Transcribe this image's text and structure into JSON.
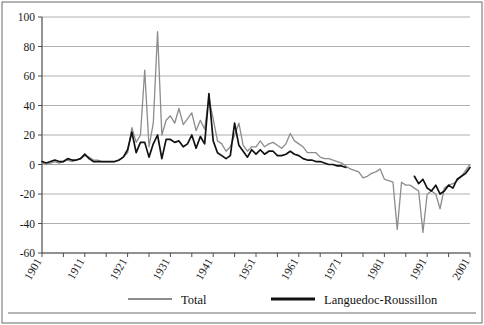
{
  "chart_data": {
    "type": "line",
    "title": "",
    "subtitle": "",
    "xlabel": "",
    "ylabel": "",
    "xlim": [
      1901,
      2001
    ],
    "ylim": [
      -60,
      100
    ],
    "y_ticks": [
      100,
      80,
      60,
      40,
      20,
      0,
      -20,
      -40,
      -60
    ],
    "y_tick_labels": [
      "100",
      "80",
      "60",
      "40",
      "20",
      "0",
      "-20",
      "-40",
      "-60"
    ],
    "x_ticks": [
      1901,
      1906,
      1911,
      1916,
      1921,
      1926,
      1931,
      1936,
      1941,
      1946,
      1951,
      1956,
      1961,
      1966,
      1971,
      1976,
      1981,
      1986,
      1991,
      1996,
      2001
    ],
    "x_tick_labels": [
      "1901",
      "1911",
      "1921",
      "1931",
      "1941",
      "1951",
      "1961",
      "1971",
      "1981",
      "1991",
      "2001"
    ],
    "x_labeled_ticks": [
      1901,
      1911,
      1921,
      1931,
      1941,
      1951,
      1961,
      1971,
      1981,
      1991,
      2001
    ],
    "grid": "horizontal",
    "legend_position": "bottom",
    "legend": [
      "Total",
      "Languedoc-Roussillon"
    ],
    "series": [
      {
        "name": "Total",
        "color": "#8c8c8c",
        "x": [
          1901,
          1902,
          1903,
          1904,
          1905,
          1906,
          1907,
          1908,
          1909,
          1910,
          1911,
          1912,
          1913,
          1914,
          1915,
          1916,
          1917,
          1918,
          1919,
          1920,
          1921,
          1922,
          1923,
          1924,
          1925,
          1926,
          1927,
          1928,
          1929,
          1930,
          1931,
          1932,
          1933,
          1934,
          1935,
          1936,
          1937,
          1938,
          1939,
          1940,
          1941,
          1942,
          1943,
          1944,
          1945,
          1946,
          1947,
          1948,
          1949,
          1950,
          1951,
          1952,
          1953,
          1954,
          1955,
          1956,
          1957,
          1958,
          1959,
          1960,
          1961,
          1962,
          1963,
          1964,
          1965,
          1966,
          1967,
          1968,
          1969,
          1970,
          1971,
          1972,
          1973,
          1974,
          1975,
          1976,
          1977,
          1978,
          1979,
          1980,
          1981,
          1982,
          1983,
          1984,
          1985,
          1986,
          1987,
          1988,
          1989,
          1990,
          1991,
          1992,
          1993,
          1994,
          1995,
          1996,
          1997,
          1998,
          1999,
          2000,
          2001
        ],
        "values": [
          1,
          0,
          1,
          2,
          1,
          2,
          3,
          2,
          3,
          4,
          6,
          5,
          3,
          3,
          2,
          2,
          2,
          2,
          3,
          5,
          8,
          25,
          15,
          20,
          64,
          12,
          28,
          90,
          20,
          30,
          33,
          28,
          38,
          27,
          31,
          35,
          23,
          30,
          24,
          45,
          31,
          16,
          14,
          9,
          12,
          20,
          28,
          13,
          9,
          12,
          12,
          16,
          12,
          14,
          15,
          13,
          11,
          14,
          21,
          16,
          14,
          12,
          8,
          8,
          8,
          5,
          4,
          4,
          3,
          2,
          1,
          -1,
          -3,
          -4,
          -5,
          -9,
          -8,
          -6,
          -5,
          -3,
          -10,
          -11,
          -12,
          -44,
          -12,
          -14,
          -14,
          -16,
          -18,
          -46,
          -20,
          -18,
          -20,
          -30,
          -16,
          -14,
          -13,
          -11,
          -8,
          -4,
          0
        ]
      },
      {
        "name": "Languedoc-Roussillon",
        "color": "#111111",
        "x": [
          1901,
          1902,
          1903,
          1904,
          1905,
          1906,
          1907,
          1908,
          1909,
          1910,
          1911,
          1912,
          1913,
          1914,
          1915,
          1916,
          1917,
          1918,
          1919,
          1920,
          1921,
          1922,
          1923,
          1924,
          1925,
          1926,
          1927,
          1928,
          1929,
          1930,
          1931,
          1932,
          1933,
          1934,
          1935,
          1936,
          1937,
          1938,
          1939,
          1940,
          1941,
          1942,
          1943,
          1944,
          1945,
          1946,
          1947,
          1948,
          1949,
          1950,
          1951,
          1952,
          1953,
          1954,
          1955,
          1956,
          1957,
          1958,
          1959,
          1960,
          1961,
          1962,
          1963,
          1964,
          1965,
          1966,
          1967,
          1968,
          1969,
          1970,
          1971,
          1972,
          1988,
          1989,
          1990,
          1991,
          1992,
          1993,
          1994,
          1995,
          1996,
          1997,
          1998,
          1999,
          2000,
          2001
        ],
        "values": [
          2,
          1,
          2,
          3,
          2,
          2,
          4,
          3,
          3,
          4,
          7,
          4,
          2,
          2,
          2,
          2,
          2,
          2,
          3,
          5,
          10,
          22,
          8,
          15,
          15,
          5,
          14,
          20,
          4,
          17,
          17,
          15,
          16,
          12,
          14,
          20,
          11,
          19,
          14,
          48,
          16,
          8,
          6,
          4,
          6,
          28,
          13,
          9,
          5,
          10,
          7,
          10,
          7,
          9,
          9,
          6,
          6,
          7,
          9,
          7,
          6,
          4,
          3,
          3,
          2,
          2,
          1,
          0,
          0,
          -1,
          -1,
          -2,
          -8,
          -13,
          -10,
          -16,
          -18,
          -14,
          -20,
          -18,
          -14,
          -16,
          -10,
          -8,
          -6,
          -2
        ]
      }
    ]
  },
  "legend": {
    "items": [
      {
        "label": "Total",
        "color": "#8c8c8c",
        "width": 2
      },
      {
        "label": "Languedoc-Roussillon",
        "color": "#111111",
        "width": 3
      }
    ]
  },
  "axes": {
    "y_labels": [
      "100",
      "80",
      "60",
      "40",
      "20",
      "0",
      "-20",
      "-40",
      "-60"
    ],
    "x_labels": [
      "1901",
      "1911",
      "1921",
      "1931",
      "1941",
      "1951",
      "1961",
      "1971",
      "1981",
      "1991",
      "2001"
    ]
  }
}
